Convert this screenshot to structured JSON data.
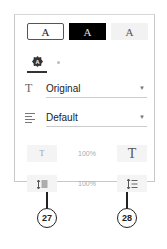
{
  "themes": [
    {
      "label": "A",
      "name": "white",
      "selected": true
    },
    {
      "label": "A",
      "name": "black",
      "selected": false
    },
    {
      "label": "A",
      "name": "gray",
      "selected": false
    }
  ],
  "font_tabs": {
    "active_icon": "font-badge-icon",
    "inactive_icon": "dot-icon"
  },
  "font_select": {
    "icon": "T",
    "value": "Original"
  },
  "align_select": {
    "icon": "align-left-icon",
    "value": "Default"
  },
  "font_size": {
    "decrease_label": "T",
    "value": "100%",
    "increase_label": "T"
  },
  "line_spacing": {
    "decrease_icon": "line-spacing-decrease-icon",
    "value": "100%",
    "increase_icon": "line-spacing-increase-icon"
  },
  "callouts": [
    {
      "number": "27"
    },
    {
      "number": "28"
    }
  ],
  "colors": {
    "border": "#c8c8c8",
    "button_bg": "#f4f4f4",
    "text": "#222222"
  }
}
